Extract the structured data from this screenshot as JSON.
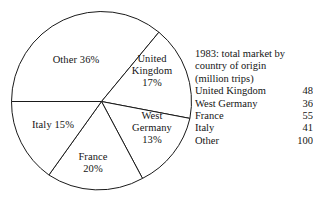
{
  "chart_data": {
    "type": "pie",
    "title": "",
    "categories": [
      "United Kingdom",
      "West Germany",
      "France",
      "Italy",
      "Other"
    ],
    "values": [
      48,
      36,
      55,
      41,
      100
    ],
    "percentages": [
      17,
      13,
      20,
      15,
      36
    ],
    "units": "million trips",
    "legend_position": "right",
    "grid": false,
    "slice_labels": [
      {
        "id": "other",
        "lines": [
          "Other 36%"
        ],
        "percent": 36,
        "category": "Other"
      },
      {
        "id": "uk",
        "lines": [
          "United",
          "Kingdom",
          "17%"
        ],
        "percent": 17,
        "category": "United Kingdom"
      },
      {
        "id": "west-germany",
        "lines": [
          "West",
          "Germany",
          "13%"
        ],
        "percent": 13,
        "category": "West Germany"
      },
      {
        "id": "france",
        "lines": [
          "France",
          "20%"
        ],
        "percent": 20,
        "category": "France"
      },
      {
        "id": "italy",
        "lines": [
          "Italy 15%"
        ],
        "percent": 15,
        "category": "Italy"
      }
    ],
    "start_angle_deg": 180,
    "direction": "clockwise",
    "stroke_color": "#1a1a1a",
    "fill_color": "#ffffff"
  },
  "slices": {
    "other": {
      "l1": "Other 36%"
    },
    "uk": {
      "l1": "United",
      "l2": "Kingdom",
      "l3": "17%"
    },
    "west_germany": {
      "l1": "West",
      "l2": "Germany",
      "l3": "13%"
    },
    "france": {
      "l1": "France",
      "l2": "20%"
    },
    "italy": {
      "l1": "Italy 15%"
    }
  },
  "legend": {
    "caption_line1": "1983: total market by",
    "caption_line2": "country of origin",
    "caption_line3": "(million trips)",
    "rows": [
      {
        "name": "United Kingdom",
        "value": "48"
      },
      {
        "name": "West Germany",
        "value": "36"
      },
      {
        "name": "France",
        "value": "55"
      },
      {
        "name": "Italy",
        "value": "41"
      },
      {
        "name": "Other",
        "value": "100"
      }
    ]
  }
}
